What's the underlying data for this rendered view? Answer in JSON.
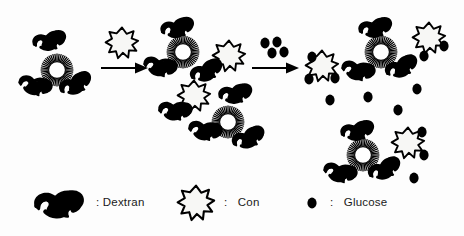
{
  "figure": {
    "type": "reaction-schematic",
    "background_color": "#fdfdfd",
    "ink_color": "#000000",
    "stages": [
      {
        "name": "stage-1-small-complex",
        "con_bound_count": 1,
        "con_free_count": 0,
        "dextran_count": 3,
        "glucose_count": 0
      },
      {
        "name": "stage-2-crosslinked-network",
        "con_bound_count": 2,
        "con_free_count": 2,
        "dextran_count": 7,
        "glucose_count": 0
      },
      {
        "name": "stage-3-glucose-dissociated",
        "con_bound_count": 2,
        "con_free_count": 3,
        "dextran_count": 6,
        "glucose_count": 13
      }
    ],
    "arrows": [
      {
        "name": "arrow-1",
        "reagent_label": "Con",
        "reagent_icon": "con-star-icon",
        "reagent_count": 1
      },
      {
        "name": "arrow-2",
        "reagent_label": "Glucose",
        "reagent_icon": "glucose-dot-icon",
        "reagent_count": 4
      }
    ]
  },
  "legend": {
    "separator": ":",
    "items": [
      {
        "icon": "dextran-squiggle-icon",
        "separator": ":",
        "label": "Dextran"
      },
      {
        "icon": "con-star-icon",
        "separator": ":",
        "label": "Con"
      },
      {
        "icon": "glucose-dot-icon",
        "separator": ":",
        "label": "Glucose"
      }
    ]
  }
}
